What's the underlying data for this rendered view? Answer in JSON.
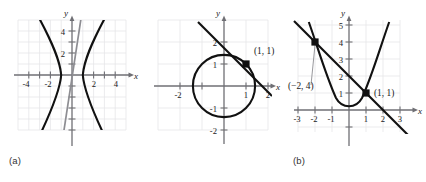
{
  "figure": {
    "title": "",
    "panel_count": 3,
    "background_color": "#ffffff",
    "grid_color": "#e3e3e6",
    "axis_color": "#6f6f74",
    "curve_color": "#111111",
    "secondary_curve_color": "#8d8d92",
    "point_color": "#111111"
  },
  "panels": [
    {
      "key": "a",
      "label": "(a)",
      "axis_labels": {
        "x": "x",
        "y": "y"
      },
      "x_ticks": [
        "-4",
        "-2",
        "2",
        "4"
      ],
      "y_ticks": [
        "2",
        "4"
      ],
      "x_range": [
        -5.6,
        5.6
      ],
      "y_range": [
        -6.2,
        6.2
      ],
      "curves": [
        {
          "name": "hyperbola",
          "style": "black",
          "equation": "x^2 - y^2/ a = 1"
        },
        {
          "name": "steep-line",
          "style": "gray",
          "equation": "y = 9x + 0.3"
        }
      ],
      "points": []
    },
    {
      "key": "b",
      "label": "(b)",
      "axis_labels": {
        "x": "x",
        "y": "y"
      },
      "x_ticks": [
        "-2",
        "1",
        "2"
      ],
      "y_ticks": [
        "2",
        "1",
        "-1",
        "-2"
      ],
      "x_range": [
        -2.7,
        2.7
      ],
      "y_range": [
        -2.5,
        2.5
      ],
      "curves": [
        {
          "name": "circle",
          "style": "black",
          "equation": "x^2 + y^2 = 2"
        },
        {
          "name": "tangent-line",
          "style": "black",
          "equation": "y = 2 - x"
        }
      ],
      "points": [
        {
          "label": "(1, 1)",
          "x": 1,
          "y": 1,
          "leader": false
        }
      ]
    },
    {
      "key": "c",
      "label": "(c)",
      "axis_labels": {
        "x": "x",
        "y": "y"
      },
      "x_ticks": [
        "-3",
        "-2",
        "-1",
        "1",
        "2",
        "3"
      ],
      "y_ticks": [
        "1",
        "2",
        "3",
        "4",
        "5"
      ],
      "x_range": [
        -3.7,
        3.7
      ],
      "y_range": [
        -1.9,
        6.2
      ],
      "curves": [
        {
          "name": "parabola",
          "style": "black",
          "equation": "y = x^2"
        },
        {
          "name": "line",
          "style": "black",
          "equation": "y = 2 - x"
        }
      ],
      "points": [
        {
          "label": "(−2, 4)",
          "x": -2,
          "y": 4,
          "leader": true
        },
        {
          "label": "(1, 1)",
          "x": 1,
          "y": 1,
          "leader": false
        }
      ]
    }
  ]
}
